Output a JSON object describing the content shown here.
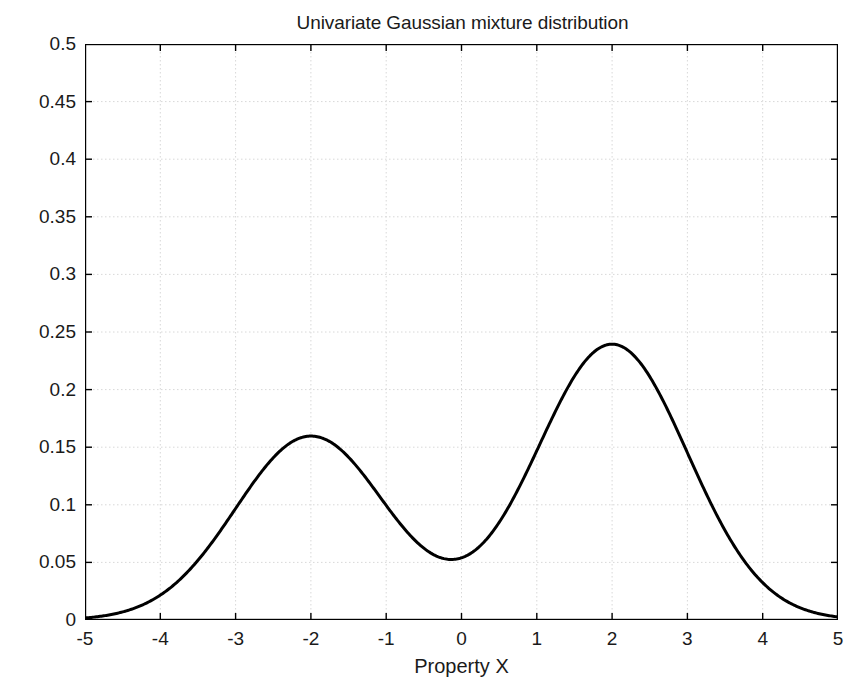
{
  "chart_data": {
    "type": "line",
    "title": "Univariate Gaussian mixture distribution",
    "xlabel": "Property X",
    "ylabel": "Probability density function",
    "xlim": [
      -5,
      5
    ],
    "ylim": [
      0,
      0.5
    ],
    "grid": true,
    "legend": null,
    "xticks": [
      -5,
      -4,
      -3,
      -2,
      -1,
      0,
      1,
      2,
      3,
      4,
      5
    ],
    "xtick_labels": [
      "-5",
      "-4",
      "-3",
      "-2",
      "-1",
      "0",
      "1",
      "2",
      "3",
      "4",
      "5"
    ],
    "yticks": [
      0,
      0.05,
      0.1,
      0.15,
      0.2,
      0.25,
      0.3,
      0.35,
      0.4,
      0.45,
      0.5
    ],
    "ytick_labels": [
      "0",
      "0.05",
      "0.1",
      "0.15",
      "0.2",
      "0.25",
      "0.3",
      "0.35",
      "0.4",
      "0.45",
      "0.5"
    ],
    "line_color": "#000000",
    "line_width": 3,
    "mixture": {
      "components": [
        {
          "weight": 0.4,
          "mean": -2,
          "sigma": 1
        },
        {
          "weight": 0.6,
          "mean": 2,
          "sigma": 1
        }
      ]
    },
    "features": {
      "left_peak": {
        "x": -2,
        "y": 0.16
      },
      "right_peak": {
        "x": 2,
        "y": 0.24
      },
      "valley": {
        "x": -0.15,
        "y": 0.053
      }
    },
    "x": [
      -5,
      -4.75,
      -4.5,
      -4.25,
      -4,
      -3.75,
      -3.5,
      -3.25,
      -3,
      -2.75,
      -2.5,
      -2.25,
      -2,
      -1.75,
      -1.5,
      -1.25,
      -1,
      -0.75,
      -0.5,
      -0.25,
      0,
      0.25,
      0.5,
      0.75,
      1,
      1.25,
      1.5,
      1.75,
      2,
      2.25,
      2.5,
      2.75,
      3,
      3.25,
      3.5,
      3.75,
      4,
      4.25,
      4.5,
      4.75,
      5
    ],
    "values": [
      0.0018,
      0.0036,
      0.0066,
      0.0115,
      0.0194,
      0.0312,
      0.0484,
      0.0719,
      0.0977,
      0.1225,
      0.1419,
      0.1557,
      0.1604,
      0.1559,
      0.1435,
      0.1253,
      0.1043,
      0.0836,
      0.0661,
      0.0558,
      0.0533,
      0.0604,
      0.0785,
      0.108,
      0.1471,
      0.1925,
      0.2391,
      0.2187,
      0.2403,
      0.2354,
      0.2174,
      0.1895,
      0.1567,
      0.1238,
      0.0949,
      0.0713,
      0.0534,
      0.0404,
      0.031,
      0.024,
      0.0186
    ]
  }
}
